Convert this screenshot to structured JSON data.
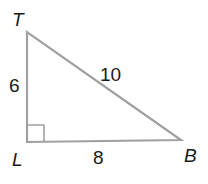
{
  "diagram": {
    "type": "right-triangle",
    "vertices": {
      "T": {
        "label": "T"
      },
      "L": {
        "label": "L"
      },
      "B": {
        "label": "B"
      }
    },
    "sides": {
      "TL": "6",
      "LB": "8",
      "TB": "10"
    },
    "right_angle_at": "L",
    "colors": {
      "stroke": "#a0a0a0",
      "text": "#1a1a1a",
      "background": "#ffffff"
    }
  }
}
